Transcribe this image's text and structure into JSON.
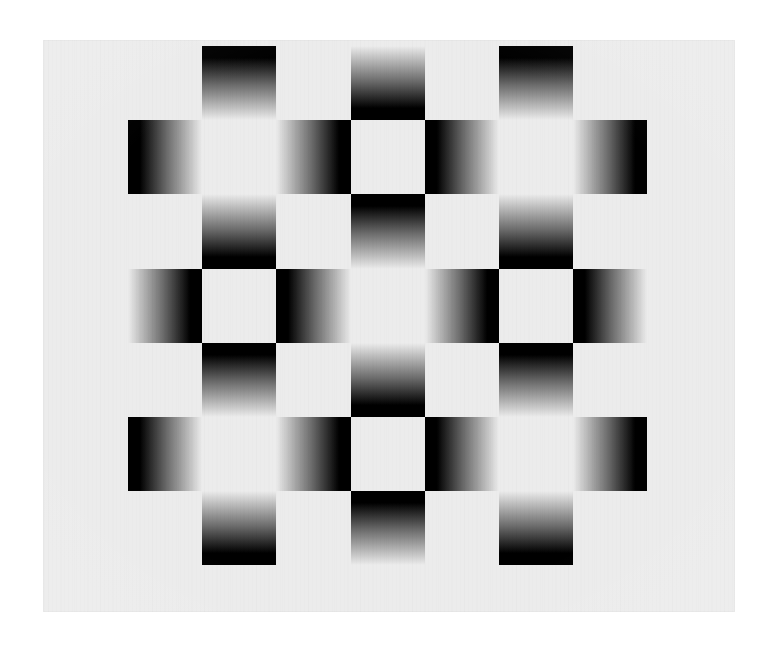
{
  "artwork": {
    "title": "Gradient Checkerboard",
    "style": "op-art",
    "medium": "printed plate",
    "description": "Seven-by-seven checkerboard of linear-gradient squares on a pale gray ground; gradients alternate direction so dark edges face inward, producing a radiating luminance illusion."
  },
  "page": {
    "width": 775,
    "height": 646,
    "background_color": "#ffffff"
  },
  "canvas": {
    "x": 43,
    "y": 40,
    "width": 692,
    "height": 572,
    "background_color": "#ececec",
    "edge_color": "#e6e6e6"
  },
  "grid": {
    "origin_x": 128,
    "origin_y": 46,
    "cell": 74.2,
    "rows": 7,
    "cols": 7,
    "dark_color": "#000000",
    "light_color": "#ececec",
    "gradient_midpoint_percent": 52,
    "notes": "Cells are present only where (row+col) is even in 0-indexed terms of the drawn lattice; odd rows carry vertical gradients, even rows carry horizontal gradients."
  },
  "cells": [
    {
      "r": 0,
      "c": 1,
      "dir": "to bottom",
      "from": "dark",
      "to": "light"
    },
    {
      "r": 0,
      "c": 3,
      "dir": "to bottom",
      "from": "light",
      "to": "dark"
    },
    {
      "r": 0,
      "c": 5,
      "dir": "to bottom",
      "from": "dark",
      "to": "light"
    },
    {
      "r": 1,
      "c": 0,
      "dir": "to right",
      "from": "dark",
      "to": "light"
    },
    {
      "r": 1,
      "c": 2,
      "dir": "to right",
      "from": "light",
      "to": "dark"
    },
    {
      "r": 1,
      "c": 4,
      "dir": "to right",
      "from": "dark",
      "to": "light"
    },
    {
      "r": 1,
      "c": 6,
      "dir": "to right",
      "from": "light",
      "to": "dark"
    },
    {
      "r": 2,
      "c": 1,
      "dir": "to bottom",
      "from": "light",
      "to": "dark"
    },
    {
      "r": 2,
      "c": 3,
      "dir": "to bottom",
      "from": "dark",
      "to": "light"
    },
    {
      "r": 2,
      "c": 5,
      "dir": "to bottom",
      "from": "light",
      "to": "dark"
    },
    {
      "r": 3,
      "c": 0,
      "dir": "to right",
      "from": "light",
      "to": "dark"
    },
    {
      "r": 3,
      "c": 2,
      "dir": "to right",
      "from": "dark",
      "to": "light"
    },
    {
      "r": 3,
      "c": 4,
      "dir": "to right",
      "from": "light",
      "to": "dark"
    },
    {
      "r": 3,
      "c": 6,
      "dir": "to right",
      "from": "dark",
      "to": "light"
    },
    {
      "r": 4,
      "c": 1,
      "dir": "to bottom",
      "from": "dark",
      "to": "light"
    },
    {
      "r": 4,
      "c": 3,
      "dir": "to bottom",
      "from": "light",
      "to": "dark"
    },
    {
      "r": 4,
      "c": 5,
      "dir": "to bottom",
      "from": "dark",
      "to": "light"
    },
    {
      "r": 5,
      "c": 0,
      "dir": "to right",
      "from": "dark",
      "to": "light"
    },
    {
      "r": 5,
      "c": 2,
      "dir": "to right",
      "from": "light",
      "to": "dark"
    },
    {
      "r": 5,
      "c": 4,
      "dir": "to right",
      "from": "dark",
      "to": "light"
    },
    {
      "r": 5,
      "c": 6,
      "dir": "to right",
      "from": "light",
      "to": "dark"
    },
    {
      "r": 6,
      "c": 1,
      "dir": "to bottom",
      "from": "light",
      "to": "dark"
    },
    {
      "r": 6,
      "c": 3,
      "dir": "to bottom",
      "from": "dark",
      "to": "light"
    },
    {
      "r": 6,
      "c": 5,
      "dir": "to bottom",
      "from": "light",
      "to": "dark"
    }
  ]
}
